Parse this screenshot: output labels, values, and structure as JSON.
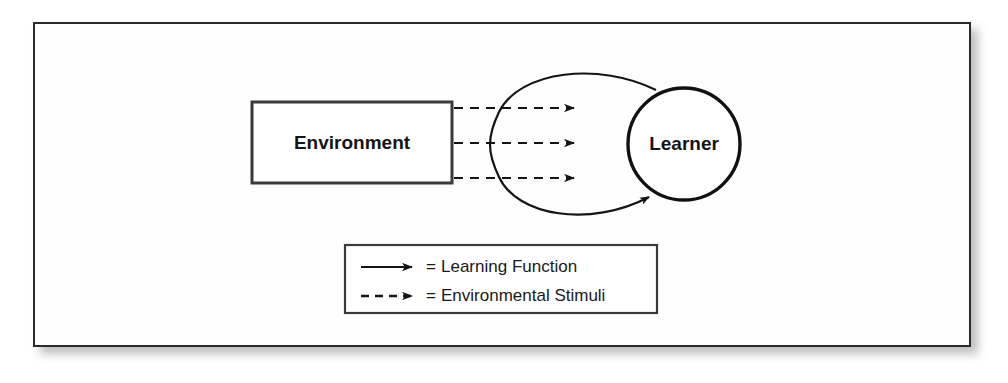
{
  "figure": {
    "background_color": "#ffffff",
    "frame_border_color": "#2b2b2b",
    "shadow_color": "#b4b4b4"
  },
  "nodes": {
    "environment": {
      "label": "Environment",
      "shape": "rectangle",
      "border_color": "#3a3a3a",
      "fill_color": "#ffffff"
    },
    "learner": {
      "label": "Learner",
      "shape": "circle",
      "border_color": "#111111",
      "fill_color": "#ffffff"
    }
  },
  "connectors": {
    "stimuli_arrows_count": 3,
    "stimuli_style": "dashed",
    "learning_loop_style": "solid",
    "stroke_color": "#141414"
  },
  "legend": {
    "border_color": "#3a3a3a",
    "items": [
      {
        "marker": "solid-arrow-icon",
        "equals": "=",
        "label": "Learning Function"
      },
      {
        "marker": "dashed-arrow-icon",
        "equals": "=",
        "label": "Environmental Stimuli"
      }
    ]
  }
}
